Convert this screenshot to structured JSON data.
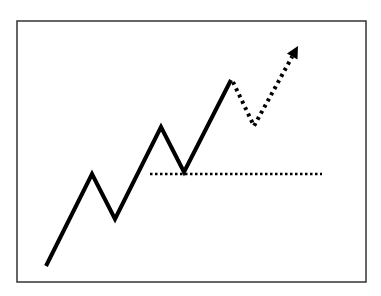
{
  "chart_data": {
    "type": "line",
    "title": "",
    "xlabel": "",
    "ylabel": "",
    "series": [
      {
        "name": "price-path",
        "style": "solid",
        "points": [
          [
            46,
            266
          ],
          [
            92,
            174
          ],
          [
            115,
            219
          ],
          [
            161,
            127
          ],
          [
            184,
            172
          ],
          [
            231,
            80
          ]
        ]
      },
      {
        "name": "projection",
        "style": "dotted",
        "points": [
          [
            233,
            82
          ],
          [
            254,
            126
          ],
          [
            298,
            46
          ]
        ],
        "arrow_end": true
      },
      {
        "name": "support-line",
        "style": "dotted",
        "points": [
          [
            150,
            174
          ],
          [
            322,
            174
          ]
        ]
      }
    ]
  },
  "colors": {
    "line": "#000000",
    "border": "#333333",
    "background": "#ffffff"
  }
}
